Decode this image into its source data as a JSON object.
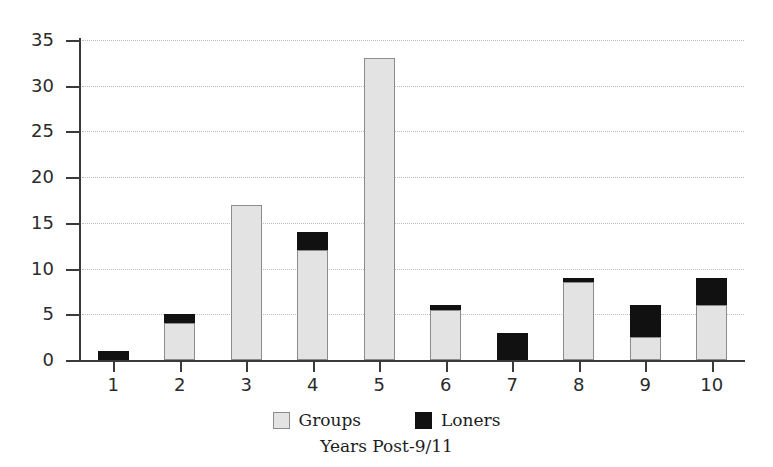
{
  "chart_data": {
    "type": "bar",
    "stacked": true,
    "title": "",
    "xlabel": "Years Post-9/11",
    "ylabel": "",
    "categories": [
      "1",
      "2",
      "3",
      "4",
      "5",
      "6",
      "7",
      "8",
      "9",
      "10"
    ],
    "series": [
      {
        "name": "Groups",
        "color": "#e3e3e3",
        "values": [
          0,
          4,
          17,
          12,
          33,
          5.5,
          0,
          8.5,
          2.5,
          6
        ]
      },
      {
        "name": "Loners",
        "color": "#111111",
        "values": [
          1,
          1,
          0,
          2,
          0,
          0.5,
          3,
          0.5,
          3.5,
          3
        ]
      }
    ],
    "totals": [
      1,
      5,
      17,
      14,
      33,
      6,
      3,
      9,
      6,
      9
    ],
    "ylim": [
      0,
      35
    ],
    "yticks": [
      "0",
      "5",
      "10",
      "15",
      "20",
      "25",
      "30",
      "35"
    ],
    "ytick_values": [
      0,
      5,
      10,
      15,
      20,
      25,
      30,
      35
    ],
    "grid": true,
    "grid_axis": "y",
    "legend_position": "bottom",
    "legend": [
      {
        "label": "Groups",
        "swatch": "groups"
      },
      {
        "label": "Loners",
        "swatch": "loners"
      }
    ]
  }
}
